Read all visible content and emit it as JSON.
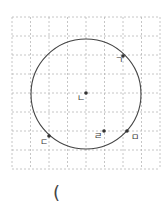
{
  "diagram": {
    "grid": {
      "x0": 12,
      "y0": 17,
      "cols": 8,
      "rows": 8,
      "cell_w": 18.5,
      "cell_h": 19,
      "color": "#b8b8b8"
    },
    "circle": {
      "cx": 86,
      "cy": 94,
      "r": 55,
      "stroke": "#444444"
    },
    "points": [
      {
        "label": "ㄱ",
        "x": 123,
        "y": 56,
        "lx": 115,
        "ly": 63
      },
      {
        "label": "ㄴ",
        "x": 86,
        "y": 93,
        "lx": 77,
        "ly": 101
      },
      {
        "label": "ㄷ",
        "x": 49,
        "y": 136,
        "lx": 40,
        "ly": 145
      },
      {
        "label": "ㄹ",
        "x": 104,
        "y": 131,
        "lx": 94,
        "ly": 139
      },
      {
        "label": "ㅁ",
        "x": 127,
        "y": 131,
        "lx": 131,
        "ly": 140
      }
    ]
  },
  "answer": {
    "open_paren": "("
  }
}
